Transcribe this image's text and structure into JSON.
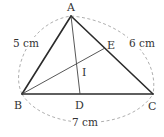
{
  "diagram": {
    "type": "triangle-angle-bisectors",
    "points": {
      "A": {
        "label": "A",
        "x": 71,
        "y": 16
      },
      "B": {
        "label": "B",
        "x": 22,
        "y": 94
      },
      "C": {
        "label": "C",
        "x": 153,
        "y": 94
      },
      "D": {
        "label": "D",
        "x": 80,
        "y": 94
      },
      "E": {
        "label": "E",
        "x": 105,
        "y": 48
      },
      "I": {
        "label": "I",
        "x": 78,
        "y": 64
      }
    },
    "segments": [
      {
        "from": "A",
        "to": "B",
        "style": "side"
      },
      {
        "from": "B",
        "to": "C",
        "style": "side"
      },
      {
        "from": "C",
        "to": "A",
        "style": "side"
      },
      {
        "from": "A",
        "to": "D",
        "style": "bisector"
      },
      {
        "from": "B",
        "to": "E",
        "style": "bisector"
      }
    ],
    "lengths": {
      "AB": "5 cm",
      "AC": "6 cm",
      "BC": "7 cm"
    },
    "colors": {
      "line": "#2b2b2b",
      "dashed_arc": "#9a9a9a",
      "text": "#333333"
    }
  }
}
